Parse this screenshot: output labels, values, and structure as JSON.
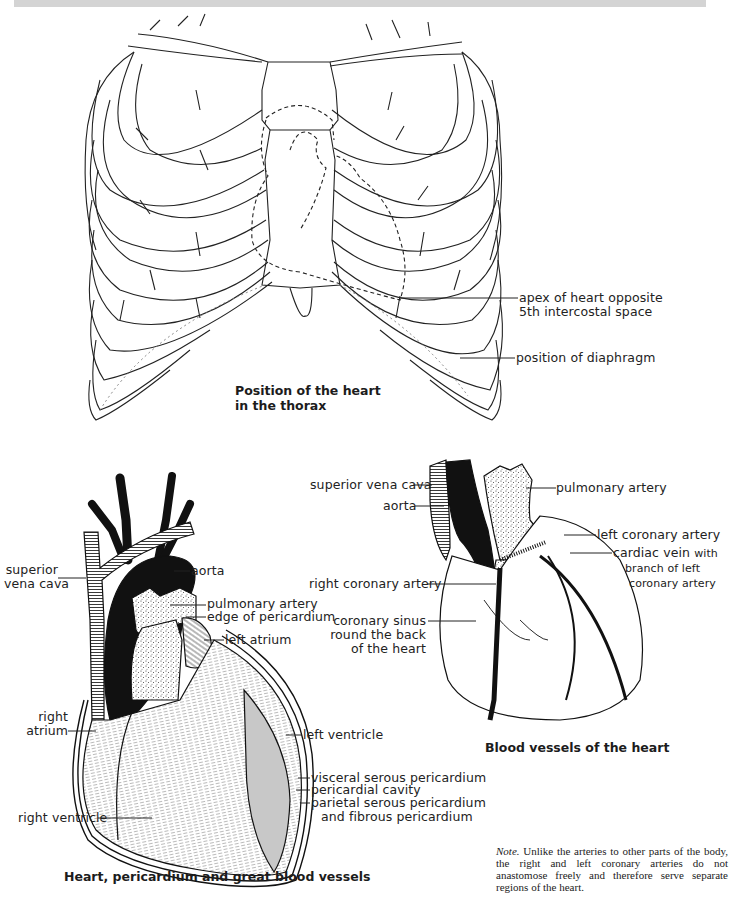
{
  "figure": {
    "panels": [
      {
        "id": "thorax",
        "caption": [
          "Position of the heart",
          "in the thorax"
        ],
        "labels": [
          {
            "text": [
              "apex of heart opposite",
              "5th intercostal space"
            ]
          },
          {
            "text": [
              "position of diaphragm"
            ]
          }
        ]
      },
      {
        "id": "pericardium",
        "caption": [
          "Heart, pericardium and great blood vessels"
        ],
        "labels": [
          {
            "text": [
              "superior",
              "vena cava"
            ]
          },
          {
            "text": [
              "aorta"
            ]
          },
          {
            "text": [
              "pulmonary artery"
            ]
          },
          {
            "text": [
              "edge of pericardium"
            ]
          },
          {
            "text": [
              "left atrium"
            ]
          },
          {
            "text": [
              "right",
              "atrium"
            ]
          },
          {
            "text": [
              "left ventricle"
            ]
          },
          {
            "text": [
              "visceral serous pericardium"
            ]
          },
          {
            "text": [
              "pericardial cavity"
            ]
          },
          {
            "text": [
              "parietal serous pericardium",
              "and fibrous pericardium"
            ]
          },
          {
            "text": [
              "right ventricle"
            ]
          }
        ]
      },
      {
        "id": "vessels",
        "caption": [
          "Blood vessels of the heart"
        ],
        "labels": [
          {
            "text": [
              "superior vena cava"
            ]
          },
          {
            "text": [
              "aorta"
            ]
          },
          {
            "text": [
              "pulmonary artery"
            ]
          },
          {
            "text": [
              "left coronary artery"
            ]
          },
          {
            "text": [
              "cardiac vein",
              "with",
              "branch of left",
              "coronary artery"
            ]
          },
          {
            "text": [
              "right coronary artery"
            ]
          },
          {
            "text": [
              "coronary sinus",
              "round the back",
              "of the heart"
            ]
          }
        ]
      }
    ],
    "note": {
      "lead": "Note.",
      "body": "Unlike the arteries to other parts of the body, the right and left coronary arteries do not anastomose freely and therefore serve separate regions of the heart."
    }
  },
  "colors": {
    "ink": "#1a1a1a",
    "background": "#ffffff",
    "topbar": "#d4d4d4"
  }
}
